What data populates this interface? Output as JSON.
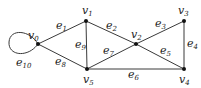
{
  "diagram": {
    "type": "graph",
    "vertices": [
      {
        "id": "v0",
        "name": "v",
        "sub": "0",
        "x": 38,
        "y": 44,
        "label_x": 28,
        "label_y": 39
      },
      {
        "id": "v1",
        "name": "v",
        "sub": "1",
        "x": 86,
        "y": 21,
        "label_x": 82,
        "label_y": 14
      },
      {
        "id": "v2",
        "name": "v",
        "sub": "2",
        "x": 136,
        "y": 44,
        "label_x": 131,
        "label_y": 38
      },
      {
        "id": "v3",
        "name": "v",
        "sub": "3",
        "x": 184,
        "y": 21,
        "label_x": 178,
        "label_y": 14
      },
      {
        "id": "v4",
        "name": "v",
        "sub": "4",
        "x": 184,
        "y": 69,
        "label_x": 179,
        "label_y": 83
      },
      {
        "id": "v5",
        "name": "v",
        "sub": "5",
        "x": 87,
        "y": 69,
        "label_x": 83,
        "label_y": 83
      }
    ],
    "edges": [
      {
        "id": "e1",
        "name": "e",
        "sub": "1",
        "from": "v0",
        "to": "v1",
        "label_x": 56,
        "label_y": 29
      },
      {
        "id": "e2",
        "name": "e",
        "sub": "2",
        "from": "v1",
        "to": "v2",
        "label_x": 106,
        "label_y": 29
      },
      {
        "id": "e3",
        "name": "e",
        "sub": "3",
        "from": "v2",
        "to": "v3",
        "label_x": 155,
        "label_y": 27
      },
      {
        "id": "e4",
        "name": "e",
        "sub": "4",
        "from": "v3",
        "to": "v4",
        "label_x": 187,
        "label_y": 47
      },
      {
        "id": "e5",
        "name": "e",
        "sub": "5",
        "from": "v2",
        "to": "v4",
        "label_x": 160,
        "label_y": 54
      },
      {
        "id": "e6",
        "name": "e",
        "sub": "6",
        "from": "v5",
        "to": "v4",
        "label_x": 128,
        "label_y": 78
      },
      {
        "id": "e7",
        "name": "e",
        "sub": "7",
        "from": "v5",
        "to": "v2",
        "label_x": 103,
        "label_y": 54
      },
      {
        "id": "e8",
        "name": "e",
        "sub": "8",
        "from": "v0",
        "to": "v5",
        "label_x": 55,
        "label_y": 65
      },
      {
        "id": "e9",
        "name": "e",
        "sub": "9",
        "from": "v1",
        "to": "v5",
        "label_x": 75,
        "label_y": 48
      },
      {
        "id": "e10",
        "name": "e",
        "sub": "10",
        "from": "v0",
        "to": "v0",
        "loop": true,
        "label_x": 16,
        "label_y": 66
      }
    ],
    "colors": {
      "edge": "#3a3a3a",
      "vertex": "#111111",
      "label": "#222222",
      "background": "#ffffff"
    }
  }
}
